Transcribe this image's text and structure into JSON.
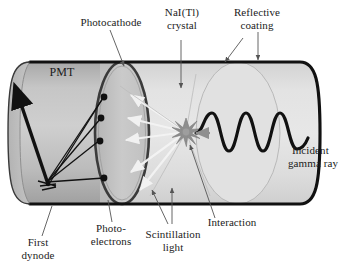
{
  "labels": {
    "photocathode": "Photocathode",
    "crystal_line1": "NaI(Tl)",
    "crystal_line2": "crystal",
    "coating_line1": "Reflective",
    "coating_line2": "coating",
    "pmt": "PMT",
    "incident_line1": "Incident",
    "incident_line2": "gamma ray",
    "interaction": "Interaction",
    "scintillation_line1": "Scintillation",
    "scintillation_line2": "light",
    "photoelectrons_line1": "Photo-",
    "photoelectrons_line2": "electrons",
    "first_dynode_line1": "First",
    "first_dynode_line2": "dynode"
  },
  "colors": {
    "outline": "#111111",
    "pmt_body": "#bdbdbd",
    "pmt_dark": "#a3a3a3",
    "crystal_body": "#dcdcdc",
    "crystal_light": "#e8e8e8",
    "photocathode_face": "#c8c8c8",
    "light_ray": "#f2f2f2",
    "starburst": "#8a8a8a",
    "leader": "#555555",
    "text": "#1b1b1b"
  },
  "elements": {
    "photoelectron_dots": 4,
    "scintillation_arrows": 5,
    "gamma_wave_cycles": 3,
    "starburst_points": 12
  }
}
